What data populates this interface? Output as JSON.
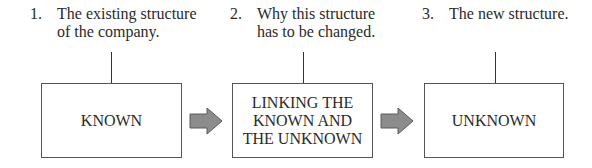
{
  "steps": [
    {
      "number": "1.",
      "description": "The existing structure\nof the company."
    },
    {
      "number": "2.",
      "description": "Why this structure\nhas to be changed."
    },
    {
      "number": "3.",
      "description": "The new structure."
    }
  ],
  "boxes": [
    {
      "label": "KNOWN"
    },
    {
      "label": "LINKING THE\nKNOWN AND\nTHE UNKNOWN"
    },
    {
      "label": "UNKNOWN"
    }
  ],
  "arrows": [
    {
      "icon": "right-arrow-icon",
      "color": "#8c8c8c"
    },
    {
      "icon": "right-arrow-icon",
      "color": "#8c8c8c"
    }
  ],
  "colors": {
    "border": "#555555",
    "arrow_fill": "#8c8c8c",
    "arrow_stroke": "#555555",
    "text": "#2a2a2a"
  }
}
